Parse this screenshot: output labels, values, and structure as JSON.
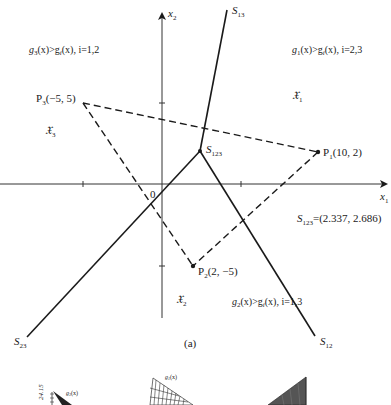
{
  "figure": {
    "panel_label": "(a)",
    "axes": {
      "x_label": "x",
      "x_sub": "1",
      "y_label": "x",
      "y_sub": "2",
      "origin_label": "0",
      "ticks": [
        -5,
        5
      ]
    },
    "points": [
      {
        "name": "P",
        "sub": "1",
        "coords": "(10, 2)",
        "x": 10,
        "y": 2
      },
      {
        "name": "P",
        "sub": "2",
        "coords": "(2, −5)",
        "x": 2,
        "y": -5
      },
      {
        "name": "P",
        "sub": "3",
        "coords": "(−5, 5)",
        "x": -5,
        "y": 5
      }
    ],
    "boundaries": [
      {
        "name": "S",
        "sub": "13"
      },
      {
        "name": "S",
        "sub": "12"
      },
      {
        "name": "S",
        "sub": "23"
      }
    ],
    "junction": {
      "name": "S",
      "sub": "123",
      "value_text": "=(2.337, 2.686)",
      "x": 2.337,
      "y": 2.686
    },
    "regions": [
      {
        "symbol": "𝔛",
        "sub": "1",
        "condition_lhs": "g",
        "lhs_sub": "1",
        "condition_mid": "(x)>g",
        "rhs_sub": "i",
        "condition_tail": "(x), i=2,3"
      },
      {
        "symbol": "𝔛",
        "sub": "2",
        "condition_lhs": "g",
        "lhs_sub": "2",
        "condition_mid": "(x)>g",
        "rhs_sub": "i",
        "condition_tail": "(x), i=1,3"
      },
      {
        "symbol": "𝔛",
        "sub": "3",
        "condition_lhs": "g",
        "lhs_sub": "3",
        "condition_mid": "(x)>g",
        "rhs_sub": "i",
        "condition_tail": "(x), i=1,2"
      }
    ]
  },
  "surface_plots": {
    "left": {
      "axis_value": "24.15",
      "func_label": "g",
      "func_sub": "3",
      "func_arg": "(x)"
    },
    "middle": {
      "func_label": "g",
      "func_sub": "1",
      "func_arg": "(x)"
    },
    "right": {}
  }
}
